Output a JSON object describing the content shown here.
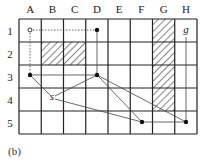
{
  "caption": "(b)",
  "grid": {
    "columns": [
      "A",
      "B",
      "C",
      "D",
      "E",
      "F",
      "G",
      "H"
    ],
    "rows": [
      "1",
      "2",
      "3",
      "4",
      "5"
    ],
    "origin": {
      "x": 19,
      "y": 19
    },
    "cell_width": 22.25,
    "cell_height": 23,
    "line_color": "#222222"
  },
  "obstacles": [
    {
      "col": "B",
      "row": "2"
    },
    {
      "col": "C",
      "row": "2"
    },
    {
      "col": "G",
      "row": "1"
    },
    {
      "col": "G",
      "row": "2"
    },
    {
      "col": "G",
      "row": "3"
    },
    {
      "col": "G",
      "row": "4"
    }
  ],
  "nodes": [
    {
      "id": "A1",
      "x": 30,
      "y": 30,
      "style": "open"
    },
    {
      "id": "D1",
      "x": 97,
      "y": 30,
      "style": "filled"
    },
    {
      "id": "A3",
      "x": 30,
      "y": 75,
      "style": "filled"
    },
    {
      "id": "D3",
      "x": 97,
      "y": 75,
      "style": "filled"
    },
    {
      "id": "F5",
      "x": 142,
      "y": 122,
      "style": "filled"
    },
    {
      "id": "H5",
      "x": 186,
      "y": 122,
      "style": "filled"
    }
  ],
  "labels": {
    "start": {
      "text": "s",
      "x": 52,
      "y": 100
    },
    "goal": {
      "text": "g",
      "x": 186,
      "y": 33
    }
  },
  "edges": [
    {
      "from": [
        30,
        30
      ],
      "to": [
        97,
        30
      ],
      "style": "dashed"
    },
    {
      "from": [
        30,
        30
      ],
      "to": [
        30,
        75
      ],
      "style": "dashed"
    },
    {
      "from": [
        97,
        30
      ],
      "to": [
        97,
        75
      ],
      "style": "solid"
    },
    {
      "from": [
        30,
        75
      ],
      "to": [
        97,
        75
      ],
      "style": "solid"
    },
    {
      "from": [
        30,
        75
      ],
      "to": [
        51,
        96
      ],
      "style": "solid"
    },
    {
      "from": [
        55,
        96
      ],
      "to": [
        97,
        75
      ],
      "style": "solid"
    },
    {
      "from": [
        55,
        99
      ],
      "to": [
        142,
        122
      ],
      "style": "solid"
    },
    {
      "from": [
        97,
        75
      ],
      "to": [
        142,
        122
      ],
      "style": "solid"
    },
    {
      "from": [
        97,
        75
      ],
      "to": [
        186,
        122
      ],
      "style": "solid"
    },
    {
      "from": [
        142,
        122
      ],
      "to": [
        186,
        122
      ],
      "style": "solid"
    },
    {
      "from": [
        186,
        37
      ],
      "to": [
        186,
        122
      ],
      "style": "solid"
    }
  ]
}
